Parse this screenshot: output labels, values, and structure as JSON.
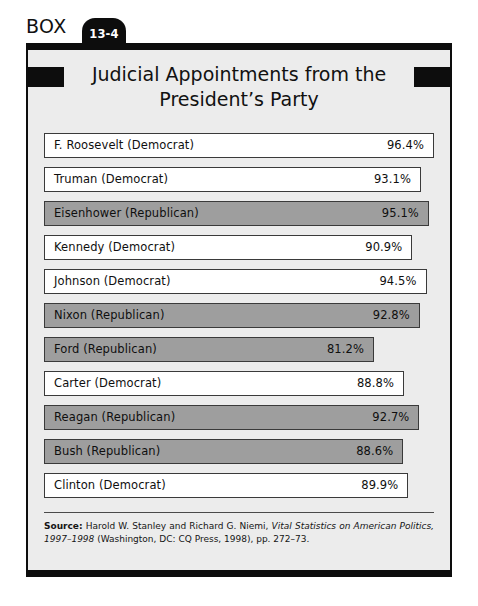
{
  "box": {
    "label": "BOX",
    "number": "13-4",
    "title_line1": "Judicial Appointments from the",
    "title_line2": "President’s Party"
  },
  "colors": {
    "frame": "#0d0d0d",
    "box_background": "#ececec",
    "democrat_fill": "#ffffff",
    "republican_fill": "#9e9e9e",
    "bar_border": "#3a3a3a"
  },
  "chart_data": {
    "type": "bar",
    "orientation": "horizontal",
    "title": "Judicial Appointments from the President’s Party",
    "xlabel": "",
    "ylabel": "",
    "xlim": [
      0,
      100
    ],
    "grid": false,
    "legend": "none",
    "value_suffix": "%",
    "categories": [
      "F. Roosevelt (Democrat)",
      "Truman (Democrat)",
      "Eisenhower (Republican)",
      "Kennedy (Democrat)",
      "Johnson (Democrat)",
      "Nixon (Republican)",
      "Ford (Republican)",
      "Carter (Democrat)",
      "Reagan (Republican)",
      "Bush (Republican)",
      "Clinton (Democrat)"
    ],
    "values": [
      96.4,
      93.1,
      95.1,
      90.9,
      94.5,
      92.8,
      81.2,
      88.8,
      92.7,
      88.6,
      89.9
    ],
    "bars": [
      {
        "label": "F. Roosevelt (Democrat)",
        "value": 96.4,
        "value_text": "96.4%",
        "party": "democrat"
      },
      {
        "label": "Truman (Democrat)",
        "value": 93.1,
        "value_text": "93.1%",
        "party": "democrat"
      },
      {
        "label": "Eisenhower (Republican)",
        "value": 95.1,
        "value_text": "95.1%",
        "party": "republican"
      },
      {
        "label": "Kennedy (Democrat)",
        "value": 90.9,
        "value_text": "90.9%",
        "party": "democrat"
      },
      {
        "label": "Johnson (Democrat)",
        "value": 94.5,
        "value_text": "94.5%",
        "party": "democrat"
      },
      {
        "label": "Nixon (Republican)",
        "value": 92.8,
        "value_text": "92.8%",
        "party": "republican"
      },
      {
        "label": "Ford (Republican)",
        "value": 81.2,
        "value_text": "81.2%",
        "party": "republican"
      },
      {
        "label": "Carter (Democrat)",
        "value": 88.8,
        "value_text": "88.8%",
        "party": "democrat"
      },
      {
        "label": "Reagan (Republican)",
        "value": 92.7,
        "value_text": "92.7%",
        "party": "republican"
      },
      {
        "label": "Bush (Republican)",
        "value": 88.6,
        "value_text": "88.6%",
        "party": "republican"
      },
      {
        "label": "Clinton (Democrat)",
        "value": 89.9,
        "value_text": "89.9%",
        "party": "democrat"
      }
    ]
  },
  "source": {
    "prefix": "Source:",
    "body_before_italic": " Harold W. Stanley and Richard G. Niemi, ",
    "italic": "Vital Statistics on American Politics, 1997–1998",
    "body_after_italic": " (Washington, DC: CQ Press, 1998), pp. 272–73."
  }
}
